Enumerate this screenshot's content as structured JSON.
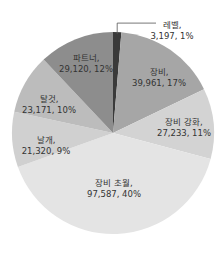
{
  "chart_data": {
    "type": "pie",
    "title": "",
    "start_angle_deg": -90,
    "direction": "clockwise",
    "center": [
      113,
      133
    ],
    "radius": 101,
    "slices": [
      {
        "name": "레벨",
        "value": 3197,
        "percent": "1%",
        "color": "#3a3a3a",
        "label_line1": "레벨,",
        "label_line2": "3,197, 1%",
        "label_pos": [
          172,
          20
        ],
        "leader": true
      },
      {
        "name": "장비",
        "value": 39961,
        "percent": "17%",
        "color": "#a6a6a6",
        "label_line1": "장비,",
        "label_line2": "39,961, 17%",
        "label_pos": [
          159,
          67
        ]
      },
      {
        "name": "장비 강화",
        "value": 27233,
        "percent": "11%",
        "color": "#d3d3d3",
        "label_line1": "장비 강화,",
        "label_line2": "27,233, 11%",
        "label_pos": [
          184,
          117
        ]
      },
      {
        "name": "장비 초월",
        "value": 97587,
        "percent": "40%",
        "color": "#e4e4e4",
        "label_line1": "장비 초월,",
        "label_line2": "97,587, 40%",
        "label_pos": [
          114,
          178
        ]
      },
      {
        "name": "날개",
        "value": 21320,
        "percent": "9%",
        "color": "#d0d0d0",
        "label_line1": "날개,",
        "label_line2": "21,320, 9%",
        "label_pos": [
          46,
          135
        ]
      },
      {
        "name": "탈것",
        "value": 23171,
        "percent": "10%",
        "color": "#bcbcbc",
        "label_line1": "탈것,",
        "label_line2": "23,171, 10%",
        "label_pos": [
          49,
          94
        ]
      },
      {
        "name": "파트너",
        "value": 29120,
        "percent": "12%",
        "color": "#8d8d8d",
        "label_line1": "파트너,",
        "label_line2": "29,120, 12%",
        "label_pos": [
          86,
          53
        ]
      }
    ],
    "legend": "none",
    "label_format": "name, value, percent"
  }
}
